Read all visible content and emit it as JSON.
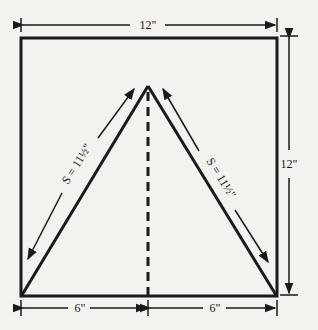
{
  "diagram": {
    "type": "square-with-triangle-pattern",
    "colors": {
      "background": "#f3f2ef",
      "ink": "#1a1a1a"
    },
    "labels": {
      "top_width": "12\"",
      "right_height": "12\"",
      "bottom_left": "6\"",
      "bottom_right": "6\"",
      "left_slant": "S = 11½\"",
      "right_slant": "S = 11½\""
    }
  }
}
